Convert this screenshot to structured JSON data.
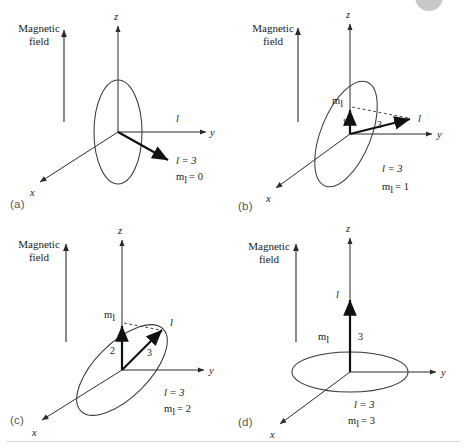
{
  "figure": {
    "axis_labels": {
      "z": "z",
      "y": "y",
      "x": "x"
    },
    "magnetic_field_label": "Magnetic\nfield",
    "magnetic_field_line1": "Magnetic",
    "magnetic_field_line2": "field",
    "vector_symbol": "l",
    "projection_symbol": "m",
    "projection_subscript": "l"
  },
  "panels": [
    {
      "id": "a",
      "letter": "(a)",
      "caption_l": "l = 3",
      "caption_ml": "m",
      "caption_ml_sub": "l",
      "caption_ml_value": "= 0",
      "l_value": 3,
      "ml_value": 0,
      "vector_label": "l",
      "ring_orientation": "vertical",
      "ring_tilt_deg": 0,
      "vector_angle_deg": -30,
      "shows_component": false,
      "shows_dashed": false,
      "component_label": "",
      "length_label": ""
    },
    {
      "id": "b",
      "letter": "(b)",
      "caption_l": "l = 3",
      "caption_ml": "m",
      "caption_ml_sub": "l",
      "caption_ml_value": "= 1",
      "l_value": 3,
      "ml_value": 1,
      "vector_label": "l",
      "ring_orientation": "tilted",
      "ring_tilt_deg": 22,
      "vector_angle_deg": 12,
      "shows_component": true,
      "shows_dashed": true,
      "component_label": "1",
      "length_label": "3"
    },
    {
      "id": "c",
      "letter": "(c)",
      "caption_l": "l = 3",
      "caption_ml": "m",
      "caption_ml_sub": "l",
      "caption_ml_value": "= 2",
      "l_value": 3,
      "ml_value": 2,
      "vector_label": "l",
      "ring_orientation": "tilted",
      "ring_tilt_deg": 45,
      "vector_angle_deg": 34,
      "shows_component": true,
      "shows_dashed": true,
      "component_label": "2",
      "length_label": "3"
    },
    {
      "id": "d",
      "letter": "(d)",
      "caption_l": "l = 3",
      "caption_ml": "m",
      "caption_ml_sub": "l",
      "caption_ml_value": "= 3",
      "l_value": 3,
      "ml_value": 3,
      "vector_label": "l",
      "ring_orientation": "horizontal",
      "ring_tilt_deg": 90,
      "vector_angle_deg": 90,
      "shows_component": true,
      "shows_dashed": false,
      "component_label": "3",
      "length_label": "3"
    }
  ]
}
